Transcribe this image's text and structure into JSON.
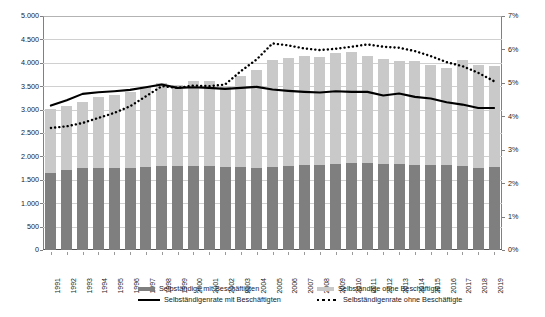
{
  "unit_label": "Tausend",
  "colors": {
    "bar_with_employees": "#7f7f7f",
    "bar_without_employees": "#c9c9c9",
    "line_rate_with": "#000000",
    "line_rate_without": "#000000",
    "gridline": "#d0d0d0",
    "axis": "#808080"
  },
  "axes": {
    "left": {
      "ticks": [
        "0",
        "500",
        "1.000",
        "1.500",
        "2.000",
        "2.500",
        "3.000",
        "3.500",
        "4.000",
        "4.500",
        "5.000"
      ],
      "min": 0,
      "max": 5000,
      "step": 500
    },
    "right": {
      "ticks": [
        "0%",
        "1%",
        "2%",
        "3%",
        "4%",
        "5%",
        "6%",
        "7%"
      ],
      "min": 0,
      "max": 7,
      "step": 1
    }
  },
  "legend": {
    "items": [
      {
        "label": "Selbständige mit Beschäftigten",
        "marker": "bar-dark-swatch"
      },
      {
        "label": "Selbständige ohne Beschäftigte",
        "marker": "bar-light-swatch"
      },
      {
        "label": "Selbständigenrate mit Beschäftigten",
        "marker": "solid-line-swatch"
      },
      {
        "label": "Selbständigenrate ohne Beschäftigte",
        "marker": "dotted-line-swatch"
      }
    ]
  },
  "chart_data": {
    "type": "bar",
    "title": "",
    "subtitle": "",
    "xlabel": "",
    "ylabel": "Tausend",
    "ylabel_secondary": "%",
    "ylim": [
      0,
      5000
    ],
    "ylim_secondary": [
      0,
      7
    ],
    "grid": true,
    "legend_position": "bottom",
    "stacked": true,
    "categories": [
      "1991",
      "1992",
      "1993",
      "1994",
      "1995",
      "1996",
      "1997",
      "1998",
      "1999",
      "2000",
      "2001",
      "2002",
      "2003",
      "2004",
      "2005",
      "2006",
      "2007",
      "2008",
      "2009",
      "2010",
      "2011",
      "2012",
      "2013",
      "2014",
      "2015",
      "2016",
      "2017",
      "2018",
      "2019"
    ],
    "series": [
      {
        "name": "Selbständige mit Beschäftigten",
        "type": "bar",
        "axis": "left",
        "unit": "Tausend",
        "values": [
          1640,
          1700,
          1750,
          1755,
          1750,
          1750,
          1765,
          1790,
          1795,
          1785,
          1785,
          1775,
          1775,
          1755,
          1770,
          1790,
          1815,
          1815,
          1830,
          1850,
          1865,
          1830,
          1830,
          1825,
          1825,
          1810,
          1785,
          1745,
          1780
        ]
      },
      {
        "name": "Selbständige ohne Beschäftigte",
        "type": "bar",
        "axis": "left",
        "unit": "Tausend",
        "values": [
          1380,
          1380,
          1420,
          1520,
          1570,
          1625,
          1745,
          1780,
          1725,
          1830,
          1825,
          1720,
          1940,
          2085,
          2295,
          2310,
          2325,
          2305,
          2370,
          2375,
          2280,
          2255,
          2215,
          2215,
          2130,
          2085,
          2270,
          2210,
          2150
        ]
      },
      {
        "name": "Selbständige gesamt (Summe Balken)",
        "type": "bar-total",
        "axis": "left",
        "unit": "Tausend",
        "values": [
          3020,
          3080,
          3170,
          3275,
          3320,
          3375,
          3510,
          3570,
          3520,
          3615,
          3610,
          3495,
          3715,
          3840,
          4065,
          4100,
          4140,
          4120,
          4200,
          4225,
          4145,
          4085,
          4045,
          4040,
          3955,
          3895,
          4055,
          3955,
          3930
        ]
      },
      {
        "name": "Selbständigenrate mit Beschäftigten",
        "type": "line",
        "style": "solid",
        "axis": "right",
        "unit": "%",
        "values": [
          4.32,
          4.48,
          4.67,
          4.72,
          4.75,
          4.79,
          4.87,
          4.95,
          4.85,
          4.87,
          4.85,
          4.82,
          4.85,
          4.88,
          4.8,
          4.76,
          4.73,
          4.71,
          4.75,
          4.73,
          4.73,
          4.62,
          4.68,
          4.58,
          4.53,
          4.42,
          4.35,
          4.25,
          4.25
        ]
      },
      {
        "name": "Selbständigenrate ohne Beschäftigte",
        "type": "line",
        "style": "dotted",
        "axis": "right",
        "unit": "%",
        "values": [
          3.65,
          3.7,
          3.8,
          3.95,
          4.1,
          4.3,
          4.6,
          4.9,
          4.85,
          4.92,
          4.9,
          4.95,
          5.35,
          5.7,
          6.18,
          6.12,
          6.03,
          5.98,
          6.02,
          6.08,
          6.15,
          6.08,
          6.05,
          5.95,
          5.8,
          5.62,
          5.5,
          5.3,
          5.05
        ]
      }
    ]
  }
}
